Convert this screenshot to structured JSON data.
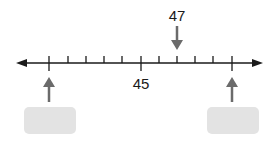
{
  "number_line": {
    "min_tick": 40,
    "max_tick": 50,
    "step": 1,
    "labeled_value": "45",
    "pointer_value": "47",
    "answer_boxes": [
      {
        "position": "left",
        "value": ""
      },
      {
        "position": "right",
        "value": ""
      }
    ]
  },
  "colors": {
    "line": "#1a1a1a",
    "arrow": "#6b6b6b",
    "box": "#e3e3e3"
  }
}
